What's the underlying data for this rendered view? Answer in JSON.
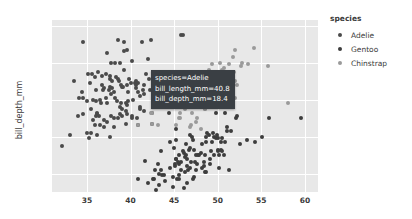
{
  "chart_data": {
    "type": "scatter",
    "title": "",
    "xlabel": "",
    "ylabel": "bill_depth_mm",
    "xlim": [
      31.0,
      61.5
    ],
    "ylim": [
      13.0,
      22.3
    ],
    "xticks": [
      "35",
      "40",
      "45",
      "50",
      "55",
      "60"
    ],
    "xtick_values": [
      35,
      40,
      45,
      50,
      55,
      60
    ],
    "yticks": [
      "22",
      "20",
      "18",
      "16",
      "14"
    ],
    "ytick_values": [
      22,
      20,
      18,
      16,
      14
    ],
    "grid": true,
    "legend_position": "right",
    "legend_title": "species",
    "series": [
      {
        "name": "Adelie",
        "color": "#4a4a4a",
        "points": [
          [
            32.1,
            15.5
          ],
          [
            33.1,
            16.1
          ],
          [
            33.5,
            19.0
          ],
          [
            34.0,
            17.1
          ],
          [
            34.1,
            18.1
          ],
          [
            34.4,
            18.4
          ],
          [
            34.5,
            18.1
          ],
          [
            34.6,
            21.1
          ],
          [
            34.6,
            17.2
          ],
          [
            35.0,
            17.9
          ],
          [
            35.0,
            16.2
          ],
          [
            35.1,
            19.4
          ],
          [
            35.2,
            15.9
          ],
          [
            35.3,
            18.9
          ],
          [
            35.5,
            16.2
          ],
          [
            35.5,
            17.5
          ],
          [
            35.6,
            19.4
          ],
          [
            35.7,
            16.9
          ],
          [
            35.7,
            18.0
          ],
          [
            35.9,
            19.2
          ],
          [
            35.9,
            16.6
          ],
          [
            36.0,
            17.1
          ],
          [
            36.0,
            17.9
          ],
          [
            36.0,
            18.5
          ],
          [
            36.2,
            17.2
          ],
          [
            36.2,
            16.1
          ],
          [
            36.2,
            17.3
          ],
          [
            36.3,
            19.5
          ],
          [
            36.4,
            17.1
          ],
          [
            36.5,
            16.6
          ],
          [
            36.5,
            18.0
          ],
          [
            36.6,
            17.8
          ],
          [
            36.7,
            18.8
          ],
          [
            36.7,
            19.3
          ],
          [
            36.8,
            18.5
          ],
          [
            36.9,
            18.6
          ],
          [
            37.0,
            16.9
          ],
          [
            37.0,
            16.5
          ],
          [
            37.2,
            18.1
          ],
          [
            37.2,
            19.4
          ],
          [
            37.3,
            20.5
          ],
          [
            37.3,
            17.8
          ],
          [
            37.3,
            16.8
          ],
          [
            37.5,
            18.5
          ],
          [
            37.6,
            19.1
          ],
          [
            37.6,
            19.3
          ],
          [
            37.7,
            18.7
          ],
          [
            37.7,
            16.0
          ],
          [
            37.8,
            18.3
          ],
          [
            37.8,
            17.1
          ],
          [
            37.8,
            20.0
          ],
          [
            37.9,
            18.6
          ],
          [
            37.9,
            19.0
          ],
          [
            38.1,
            16.5
          ],
          [
            38.1,
            17.0
          ],
          [
            38.1,
            18.4
          ],
          [
            38.2,
            18.1
          ],
          [
            38.2,
            20.0
          ],
          [
            38.3,
            19.2
          ],
          [
            38.5,
            17.9
          ],
          [
            38.6,
            21.2
          ],
          [
            38.6,
            17.0
          ],
          [
            38.6,
            19.1
          ],
          [
            38.7,
            19.0
          ],
          [
            38.8,
            17.2
          ],
          [
            38.8,
            20.0
          ],
          [
            38.8,
            17.6
          ],
          [
            38.9,
            17.8
          ],
          [
            38.9,
            18.8
          ],
          [
            39.0,
            17.5
          ],
          [
            39.0,
            18.7
          ],
          [
            39.0,
            17.1
          ],
          [
            39.1,
            18.7
          ],
          [
            39.2,
            19.6
          ],
          [
            39.2,
            21.1
          ],
          [
            39.3,
            20.6
          ],
          [
            39.5,
            17.4
          ],
          [
            39.5,
            16.7
          ],
          [
            39.5,
            17.8
          ],
          [
            39.6,
            17.7
          ],
          [
            39.6,
            18.8
          ],
          [
            39.6,
            17.2
          ],
          [
            39.6,
            20.7
          ],
          [
            39.7,
            18.4
          ],
          [
            39.7,
            17.9
          ],
          [
            39.8,
            19.1
          ],
          [
            40.1,
            18.9
          ],
          [
            40.2,
            17.1
          ],
          [
            40.2,
            20.1
          ],
          [
            40.2,
            17.0
          ],
          [
            40.3,
            18.0
          ],
          [
            40.5,
            18.9
          ],
          [
            40.6,
            18.6
          ],
          [
            40.6,
            18.8
          ],
          [
            40.6,
            19.0
          ],
          [
            40.7,
            17.0
          ],
          [
            40.8,
            18.4
          ],
          [
            40.9,
            16.6
          ],
          [
            40.9,
            18.9
          ],
          [
            41.1,
            17.6
          ],
          [
            41.1,
            18.2
          ],
          [
            41.1,
            17.5
          ],
          [
            41.3,
            21.1
          ],
          [
            41.4,
            18.5
          ],
          [
            41.5,
            18.3
          ],
          [
            41.5,
            17.4
          ],
          [
            41.6,
            18.8
          ],
          [
            41.8,
            19.4
          ],
          [
            42.0,
            20.2
          ],
          [
            42.1,
            19.1
          ],
          [
            42.2,
            18.5
          ],
          [
            42.3,
            21.2
          ],
          [
            42.5,
            16.7
          ],
          [
            42.5,
            17.3
          ],
          [
            42.7,
            18.3
          ],
          [
            42.8,
            18.5
          ],
          [
            42.9,
            17.6
          ],
          [
            43.1,
            19.2
          ],
          [
            43.2,
            19.0
          ],
          [
            44.1,
            18.0
          ],
          [
            45.8,
            21.5
          ],
          [
            46.0,
            21.5
          ]
        ]
      },
      {
        "name": "Gentoo",
        "color": "#3d3d3d",
        "points": [
          [
            40.9,
            13.7
          ],
          [
            41.7,
            14.7
          ],
          [
            42.0,
            13.5
          ],
          [
            42.6,
            13.7
          ],
          [
            42.7,
            13.7
          ],
          [
            42.8,
            14.2
          ],
          [
            42.9,
            13.1
          ],
          [
            43.3,
            13.4
          ],
          [
            43.3,
            14.0
          ],
          [
            43.5,
            14.2
          ],
          [
            43.5,
            15.2
          ],
          [
            43.6,
            13.9
          ],
          [
            43.8,
            13.9
          ],
          [
            44.0,
            13.6
          ],
          [
            44.4,
            17.3
          ],
          [
            44.5,
            14.3
          ],
          [
            44.5,
            15.7
          ],
          [
            44.9,
            13.3
          ],
          [
            44.9,
            13.8
          ],
          [
            45.0,
            15.4
          ],
          [
            45.1,
            14.5
          ],
          [
            45.1,
            14.4
          ],
          [
            45.2,
            14.8
          ],
          [
            45.2,
            15.8
          ],
          [
            45.2,
            16.4
          ],
          [
            45.3,
            13.7
          ],
          [
            45.4,
            14.6
          ],
          [
            45.5,
            13.7
          ],
          [
            45.5,
            14.5
          ],
          [
            45.5,
            15.0
          ],
          [
            45.5,
            13.9
          ],
          [
            45.8,
            14.2
          ],
          [
            45.8,
            14.6
          ],
          [
            46.1,
            13.2
          ],
          [
            46.1,
            15.1
          ],
          [
            46.2,
            14.1
          ],
          [
            46.2,
            14.9
          ],
          [
            46.4,
            15.0
          ],
          [
            46.4,
            15.6
          ],
          [
            46.5,
            13.5
          ],
          [
            46.5,
            14.8
          ],
          [
            46.5,
            14.4
          ],
          [
            46.6,
            14.2
          ],
          [
            46.7,
            15.3
          ],
          [
            46.8,
            14.3
          ],
          [
            46.8,
            15.4
          ],
          [
            46.8,
            16.1
          ],
          [
            46.9,
            14.6
          ],
          [
            47.2,
            13.7
          ],
          [
            47.2,
            15.8
          ],
          [
            47.3,
            13.8
          ],
          [
            47.3,
            15.3
          ],
          [
            47.4,
            14.6
          ],
          [
            47.5,
            14.2
          ],
          [
            47.5,
            15.0
          ],
          [
            47.6,
            14.5
          ],
          [
            47.7,
            15.0
          ],
          [
            47.8,
            15.0
          ],
          [
            48.1,
            15.1
          ],
          [
            48.2,
            14.3
          ],
          [
            48.2,
            15.6
          ],
          [
            48.4,
            14.4
          ],
          [
            48.4,
            14.6
          ],
          [
            48.5,
            14.1
          ],
          [
            48.5,
            15.0
          ],
          [
            48.6,
            16.0
          ],
          [
            48.7,
            14.1
          ],
          [
            48.7,
            15.7
          ],
          [
            48.8,
            16.2
          ],
          [
            49.0,
            16.1
          ],
          [
            49.1,
            14.5
          ],
          [
            49.1,
            14.8
          ],
          [
            49.2,
            15.2
          ],
          [
            49.3,
            15.7
          ],
          [
            49.5,
            16.2
          ],
          [
            49.6,
            16.0
          ],
          [
            49.6,
            15.0
          ],
          [
            49.8,
            15.9
          ],
          [
            49.8,
            17.3
          ],
          [
            49.9,
            16.1
          ],
          [
            50.0,
            15.2
          ],
          [
            50.0,
            15.3
          ],
          [
            50.0,
            15.9
          ],
          [
            50.1,
            15.0
          ],
          [
            50.2,
            14.3
          ],
          [
            50.4,
            15.3
          ],
          [
            50.4,
            15.7
          ],
          [
            50.5,
            15.9
          ],
          [
            50.5,
            15.2
          ],
          [
            50.7,
            15.0
          ],
          [
            50.8,
            17.3
          ],
          [
            50.8,
            15.7
          ],
          [
            51.1,
            16.3
          ],
          [
            51.1,
            16.5
          ],
          [
            51.3,
            14.2
          ],
          [
            51.5,
            16.3
          ],
          [
            52.1,
            17.0
          ],
          [
            52.2,
            17.1
          ],
          [
            52.5,
            15.6
          ],
          [
            53.4,
            15.8
          ],
          [
            54.3,
            15.7
          ],
          [
            55.1,
            16.0
          ],
          [
            55.9,
            17.0
          ],
          [
            59.6,
            17.0
          ],
          [
            45.2,
            14.8
          ],
          [
            47.0,
            16.0
          ],
          [
            43.2,
            14.5
          ],
          [
            46.0,
            15.2
          ]
        ]
      },
      {
        "name": "Chinstrap",
        "color": "#9a9a9a",
        "points": [
          [
            40.9,
            16.6
          ],
          [
            42.4,
            17.3
          ],
          [
            42.5,
            17.3
          ],
          [
            42.5,
            16.7
          ],
          [
            43.2,
            16.6
          ],
          [
            43.5,
            18.1
          ],
          [
            45.2,
            16.6
          ],
          [
            45.2,
            17.8
          ],
          [
            45.4,
            18.7
          ],
          [
            45.5,
            17.0
          ],
          [
            45.6,
            19.4
          ],
          [
            45.7,
            17.0
          ],
          [
            45.7,
            17.3
          ],
          [
            46.0,
            18.9
          ],
          [
            46.1,
            18.2
          ],
          [
            46.2,
            17.5
          ],
          [
            46.4,
            17.8
          ],
          [
            46.5,
            17.9
          ],
          [
            46.6,
            17.8
          ],
          [
            46.7,
            17.9
          ],
          [
            46.8,
            16.5
          ],
          [
            46.9,
            16.6
          ],
          [
            47.0,
            17.3
          ],
          [
            47.5,
            16.8
          ],
          [
            47.6,
            18.3
          ],
          [
            48.1,
            16.4
          ],
          [
            48.5,
            17.5
          ],
          [
            49.0,
            19.6
          ],
          [
            49.2,
            18.2
          ],
          [
            49.3,
            19.9
          ],
          [
            49.5,
            19.0
          ],
          [
            49.6,
            18.2
          ],
          [
            49.7,
            18.6
          ],
          [
            50.0,
            19.5
          ],
          [
            50.1,
            17.9
          ],
          [
            50.2,
            18.7
          ],
          [
            50.2,
            18.8
          ],
          [
            50.3,
            20.0
          ],
          [
            50.5,
            18.4
          ],
          [
            50.5,
            19.6
          ],
          [
            50.6,
            19.4
          ],
          [
            50.7,
            19.7
          ],
          [
            50.8,
            18.5
          ],
          [
            50.8,
            19.0
          ],
          [
            50.9,
            19.1
          ],
          [
            51.0,
            18.8
          ],
          [
            51.3,
            19.9
          ],
          [
            51.3,
            18.2
          ],
          [
            51.3,
            19.2
          ],
          [
            51.4,
            19.0
          ],
          [
            51.5,
            18.7
          ],
          [
            51.7,
            20.3
          ],
          [
            51.9,
            19.5
          ],
          [
            52.0,
            18.1
          ],
          [
            52.0,
            19.0
          ],
          [
            52.0,
            20.7
          ],
          [
            52.2,
            18.8
          ],
          [
            52.7,
            19.8
          ],
          [
            52.8,
            20.0
          ],
          [
            53.5,
            19.9
          ],
          [
            54.2,
            20.8
          ],
          [
            55.8,
            19.8
          ],
          [
            58.0,
            17.8
          ],
          [
            46.5,
            17.9
          ],
          [
            47.6,
            17.0
          ],
          [
            48.5,
            17.5
          ]
        ]
      }
    ]
  },
  "tooltip": {
    "visible": true,
    "lines": [
      "species=Adelie",
      "bill_length_mm=40.8",
      "bill_depth_mm=18.4"
    ],
    "anchor": [
      40.8,
      18.4
    ],
    "background": "#3a3f44",
    "text_color": "#ffffff"
  },
  "legend": {
    "title": "species",
    "items": [
      {
        "label": "Adelie",
        "color": "#4a4a4a"
      },
      {
        "label": "Gentoo",
        "color": "#3d3d3d"
      },
      {
        "label": "Chinstrap",
        "color": "#9a9a9a"
      }
    ]
  },
  "theme": {
    "plot_background": "#e8e8e8",
    "paper_background": "#ffffff",
    "gridline_color": "#ffffff",
    "tick_color": "#3a3a3a"
  }
}
